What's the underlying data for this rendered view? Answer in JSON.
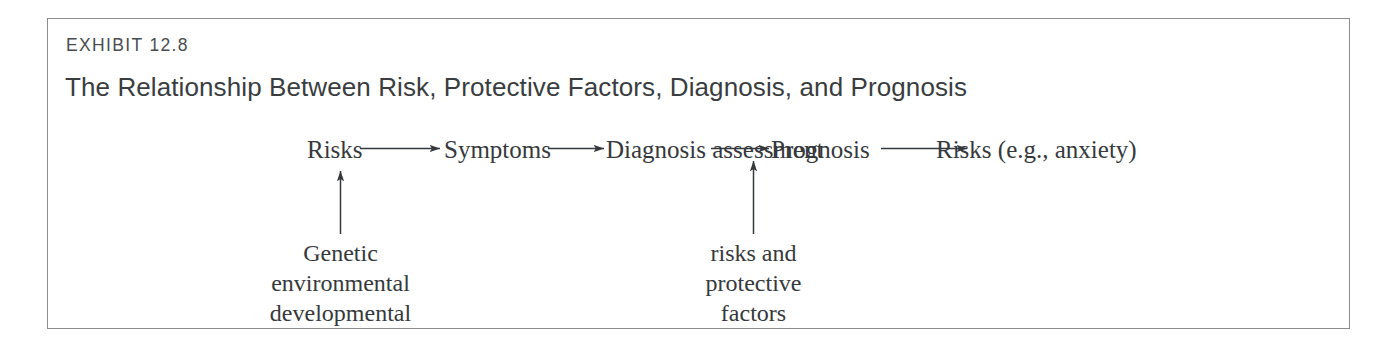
{
  "exhibit": {
    "label": "EXHIBIT 12.8",
    "title": "The Relationship Between Risk, Protective Factors, Diagnosis, and Prognosis",
    "border_color": "#8b8d8f",
    "label_color": "#4a4d50",
    "title_color": "#3a3d40",
    "background": "#ffffff"
  },
  "diagram": {
    "type": "flow-diagram",
    "ink_color": "#36393c",
    "flow_nodes": [
      {
        "id": "risks",
        "label": "Risks"
      },
      {
        "id": "symptoms",
        "label": "Symptoms"
      },
      {
        "id": "diagnosis",
        "label_line1": "Diagnosis",
        "label_line2": "assessment"
      },
      {
        "id": "prognosis",
        "label": "Prognosis"
      },
      {
        "id": "risks-outcome",
        "label": "Risks (e.g., anxiety)"
      }
    ],
    "flow_arrows": [
      {
        "from": "risks",
        "to": "symptoms",
        "direction": "right"
      },
      {
        "from": "symptoms",
        "to": "diagnosis",
        "direction": "right"
      },
      {
        "from": "diagnosis",
        "to": "prognosis",
        "direction": "right"
      },
      {
        "from": "prognosis",
        "to": "risks-outcome",
        "direction": "right"
      }
    ],
    "input_labels": [
      {
        "id": "genetic-inputs",
        "target": "risks",
        "direction": "up",
        "lines": [
          "Genetic",
          "environmental",
          "developmental"
        ]
      },
      {
        "id": "risk-protective-inputs",
        "target": "diagnosis",
        "direction": "up",
        "lines": [
          "risks and",
          "protective",
          "factors"
        ]
      }
    ]
  }
}
